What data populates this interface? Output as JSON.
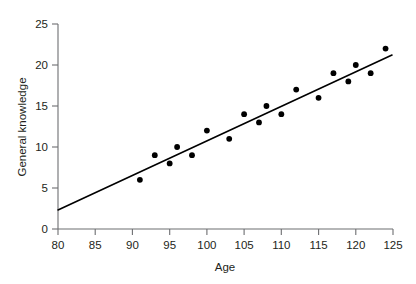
{
  "chart_data": {
    "type": "scatter",
    "title": "",
    "subtitle": "",
    "xlabel": "Age",
    "ylabel": "General knowledge",
    "xlim": [
      80,
      125
    ],
    "ylim": [
      0,
      25
    ],
    "xticks": [
      80,
      85,
      90,
      95,
      100,
      105,
      110,
      115,
      120,
      125
    ],
    "yticks": [
      0,
      5,
      10,
      15,
      20,
      25
    ],
    "xtick_labels": [
      "80",
      "85",
      "90",
      "95",
      "100",
      "105",
      "110",
      "115",
      "120",
      "125"
    ],
    "ytick_labels": [
      "0",
      "5",
      "10",
      "15",
      "20",
      "25"
    ],
    "grid": false,
    "legend": null,
    "legend_position": "none",
    "marker": {
      "shape": "circle",
      "color": "#000000",
      "size_px": 5.2
    },
    "points": [
      {
        "x": 91,
        "y": 6
      },
      {
        "x": 93,
        "y": 9
      },
      {
        "x": 95,
        "y": 8
      },
      {
        "x": 96,
        "y": 10
      },
      {
        "x": 98,
        "y": 9
      },
      {
        "x": 100,
        "y": 12
      },
      {
        "x": 103,
        "y": 11
      },
      {
        "x": 105,
        "y": 14
      },
      {
        "x": 107,
        "y": 13
      },
      {
        "x": 108,
        "y": 15
      },
      {
        "x": 110,
        "y": 14
      },
      {
        "x": 112,
        "y": 17
      },
      {
        "x": 115,
        "y": 16
      },
      {
        "x": 117,
        "y": 19
      },
      {
        "x": 119,
        "y": 18
      },
      {
        "x": 120,
        "y": 20
      },
      {
        "x": 122,
        "y": 19
      },
      {
        "x": 124,
        "y": 22
      }
    ],
    "series": [
      {
        "name": "General knowledge vs Age",
        "type": "scatter",
        "x": [
          91,
          93,
          95,
          96,
          98,
          100,
          103,
          105,
          107,
          108,
          110,
          112,
          115,
          117,
          119,
          120,
          122,
          124
        ],
        "values": [
          6,
          9,
          8,
          10,
          9,
          12,
          11,
          14,
          13,
          15,
          14,
          17,
          16,
          19,
          18,
          20,
          19,
          22
        ]
      },
      {
        "name": "Regression line",
        "type": "line",
        "x": [
          80,
          125
        ],
        "values": [
          2.3,
          21.2
        ],
        "color": "#000000"
      }
    ],
    "trendline": {
      "x_start": 80,
      "y_start": 2.3,
      "x_end": 125,
      "y_end": 21.2,
      "slope": 0.42,
      "intercept": -31.3,
      "color": "#000000"
    },
    "colors": {
      "marker": "#000000",
      "line": "#000000",
      "axis": "#6d6e71",
      "text": "#231f20",
      "background": "#ffffff"
    }
  }
}
